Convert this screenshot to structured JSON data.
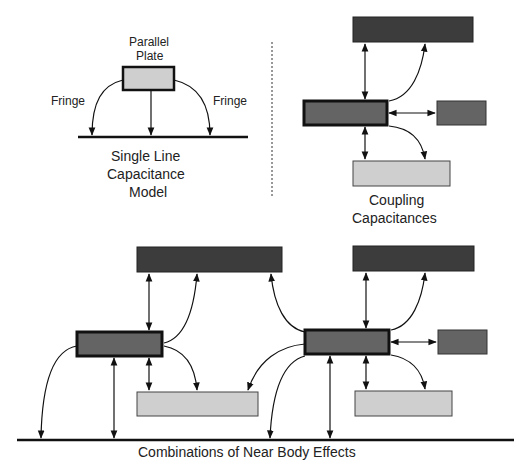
{
  "single_line": {
    "top_label_1": "Parallel",
    "top_label_2": "Plate",
    "fringe_left": "Fringe",
    "fringe_right": "Fringe",
    "caption_1": "Single Line",
    "caption_2": "Capacitance",
    "caption_3": "Model"
  },
  "coupling": {
    "caption_1": "Coupling",
    "caption_2": "Capacitances"
  },
  "combination": {
    "caption": "Combinations of Near Body Effects"
  },
  "colors": {
    "dark_conductor": "#3c3c3c",
    "mid_conductor": "#626262",
    "light_conductor": "#cccccc",
    "line": "#111111"
  }
}
